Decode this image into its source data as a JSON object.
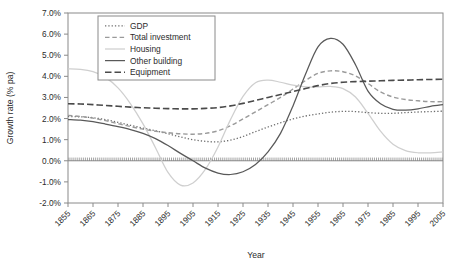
{
  "chart_data": {
    "type": "line",
    "title": "",
    "xlabel": "Year",
    "ylabel": "Growth rate (% pa)",
    "xlim": [
      1855,
      2005
    ],
    "ylim": [
      -2.0,
      7.0
    ],
    "ytick_step": 1.0,
    "xtick_step": 10,
    "grid": false,
    "legend_position": "top-left-inside",
    "xticks": [
      "1855",
      "1865",
      "1875",
      "1885",
      "1895",
      "1905",
      "1915",
      "1925",
      "1935",
      "1945",
      "1955",
      "1965",
      "1975",
      "1985",
      "1995",
      "2005"
    ],
    "yticks": [
      "-2.0%",
      "-1.0%",
      "0.0%",
      "1.0%",
      "2.0%",
      "3.0%",
      "4.0%",
      "5.0%",
      "6.0%",
      "7.0%"
    ],
    "x": [
      1855,
      1860,
      1865,
      1870,
      1875,
      1880,
      1885,
      1890,
      1895,
      1900,
      1905,
      1910,
      1915,
      1920,
      1925,
      1930,
      1935,
      1940,
      1945,
      1950,
      1955,
      1960,
      1965,
      1970,
      1975,
      1980,
      1985,
      1990,
      1995,
      2000,
      2005
    ],
    "series": [
      {
        "name": "GDP",
        "style": "dotted",
        "color": "#6e6e6e",
        "values": [
          2.1,
          2.08,
          2.04,
          1.95,
          1.82,
          1.68,
          1.55,
          1.42,
          1.28,
          1.13,
          1.0,
          0.92,
          0.9,
          0.98,
          1.15,
          1.38,
          1.6,
          1.8,
          1.98,
          2.12,
          2.22,
          2.3,
          2.34,
          2.33,
          2.28,
          2.25,
          2.25,
          2.28,
          2.31,
          2.33,
          2.35
        ]
      },
      {
        "name": "Total investment",
        "style": "dashed",
        "color": "#9a9a9a",
        "values": [
          2.15,
          2.1,
          2.02,
          1.9,
          1.76,
          1.62,
          1.5,
          1.4,
          1.33,
          1.28,
          1.26,
          1.3,
          1.42,
          1.66,
          1.98,
          2.32,
          2.66,
          3.0,
          3.4,
          3.8,
          4.14,
          4.26,
          4.22,
          4.02,
          3.66,
          3.26,
          3.02,
          2.9,
          2.84,
          2.8,
          2.8
        ]
      },
      {
        "name": "Housing",
        "style": "solid",
        "color": "#cfcfcf",
        "values": [
          4.35,
          4.33,
          4.22,
          3.95,
          3.45,
          2.7,
          1.75,
          0.62,
          -0.55,
          -1.15,
          -1.05,
          -0.4,
          0.65,
          1.95,
          3.05,
          3.7,
          3.82,
          3.72,
          3.58,
          3.5,
          3.5,
          3.52,
          3.42,
          3.02,
          2.25,
          1.4,
          0.78,
          0.48,
          0.38,
          0.38,
          0.42
        ]
      },
      {
        "name": "Other building",
        "style": "solid",
        "color": "#595959",
        "values": [
          1.95,
          1.92,
          1.85,
          1.74,
          1.62,
          1.48,
          1.3,
          1.05,
          0.72,
          0.35,
          0.0,
          -0.35,
          -0.58,
          -0.65,
          -0.52,
          -0.18,
          0.42,
          1.3,
          2.6,
          4.1,
          5.4,
          5.8,
          5.52,
          4.55,
          3.3,
          2.7,
          2.44,
          2.4,
          2.46,
          2.58,
          2.66
        ]
      },
      {
        "name": "Equipment",
        "style": "longdash",
        "color": "#4a4a4a",
        "values": [
          2.7,
          2.69,
          2.66,
          2.62,
          2.58,
          2.54,
          2.51,
          2.49,
          2.47,
          2.46,
          2.46,
          2.48,
          2.52,
          2.6,
          2.72,
          2.86,
          3.0,
          3.14,
          3.28,
          3.42,
          3.56,
          3.66,
          3.72,
          3.75,
          3.77,
          3.79,
          3.81,
          3.82,
          3.84,
          3.85,
          3.86
        ]
      }
    ]
  },
  "legend": {
    "items": [
      {
        "label": "GDP"
      },
      {
        "label": "Total investment"
      },
      {
        "label": "Housing"
      },
      {
        "label": "Other building"
      },
      {
        "label": "Equipment"
      }
    ]
  },
  "colors": {
    "gdp": "#6e6e6e",
    "total_investment": "#9a9a9a",
    "housing": "#cfcfcf",
    "other_building": "#595959",
    "equipment": "#4a4a4a",
    "axis": "#8a8a8a",
    "text": "#2b2b2b",
    "background": "#ffffff"
  }
}
